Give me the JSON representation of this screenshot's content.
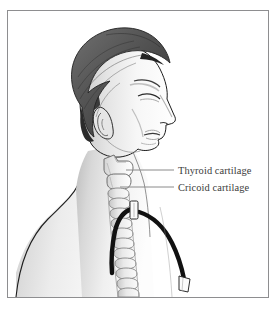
{
  "figure": {
    "frame_border_color": "#8e8e90",
    "background_color": "#ffffff"
  },
  "labels": [
    {
      "id": "thyroid-cartilage",
      "text": "Thyroid cartilage",
      "text_color": "#3b3b3b",
      "leader_color": "#8a8a8a",
      "text_x": 170,
      "text_y": 165,
      "leader": {
        "x1": 118,
        "y1": 159,
        "x2": 166,
        "y2": 159
      }
    },
    {
      "id": "cricoid-cartilage",
      "text": "Cricoid cartilage",
      "text_color": "#3b3b3b",
      "leader_color": "#8a8a8a",
      "text_x": 170,
      "text_y": 181,
      "leader": {
        "x1": 112,
        "y1": 176,
        "x2": 166,
        "y2": 176
      }
    }
  ],
  "anatomy": {
    "hair_color": "#5a5a5a",
    "hair_shadow_color": "#2f2f2f",
    "skin_light": "#fdfdfd",
    "skin_mid": "#e2e2e2",
    "skin_shadow": "#bdbdbd",
    "outline_color": "#1d1d1d",
    "cartilage_fill": "#e8e8e8",
    "cartilage_outline": "#7a7a7a",
    "parts": [
      "hair",
      "face-profile",
      "ear",
      "neck",
      "shoulder",
      "thyroid-cartilage",
      "cricoid-cartilage",
      "tracheal-rings"
    ]
  },
  "device": {
    "name": "tracheostomy-tube",
    "tube_color": "#111111",
    "flange_color": "#fafafa",
    "connector_color": "#fafafa",
    "parts": [
      "neck-flange",
      "inner-cannula",
      "outer-tube",
      "connector-hub"
    ]
  }
}
